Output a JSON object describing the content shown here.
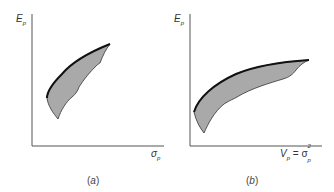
{
  "panels": [
    {
      "id": "a",
      "caption_open": "(",
      "caption_letter": "a",
      "caption_close": ")",
      "y_label_main": "E",
      "y_label_sub": "p",
      "x_label_main": "σ",
      "x_label_sub": "p",
      "description": "Feasible set of portfolios in expected return vs. standard deviation space; upper-left boundary is the efficient frontier (bold)."
    },
    {
      "id": "b",
      "caption_open": "(",
      "caption_letter": "b",
      "caption_close": ")",
      "y_label_main": "E",
      "y_label_sub": "p",
      "x_label_main": "V",
      "x_label_sub": "p",
      "x_label_eq": " = σ",
      "x_label_sup": "2",
      "x_label_sub2": "p",
      "description": "Feasible set of portfolios in expected return vs. variance space; upper-left boundary is the efficient frontier (bold)."
    }
  ],
  "colors": {
    "fill": "#a9a9a9",
    "axis": "#555555",
    "frontier": "#111111",
    "boundary": "#333333"
  }
}
